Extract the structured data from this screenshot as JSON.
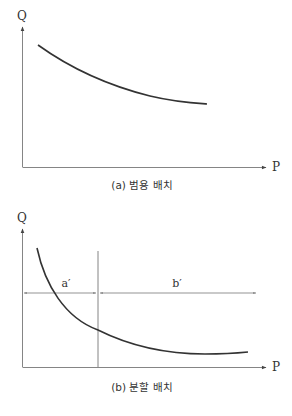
{
  "figure_a": {
    "y_axis_label": "Q",
    "x_axis_label": "P",
    "caption": "(a) 범용 배치",
    "curve": "decreasing convex curve of Q vs P"
  },
  "figure_b": {
    "y_axis_label": "Q",
    "x_axis_label": "P",
    "caption": "(b) 분할 배치",
    "region_left_label": "a′",
    "region_right_label": "b′",
    "curve": "steeply decreasing curve, flattening to near-constant; split by vertical line into regions a′ and b′"
  },
  "colors": {
    "line": "#333333",
    "axis": "#777777",
    "background": "#ffffff"
  }
}
